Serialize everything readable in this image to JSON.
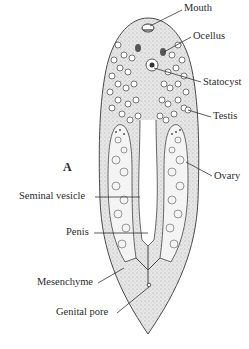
{
  "figure": {
    "panel_letter": "A",
    "colors": {
      "outline": "#4a4a4a",
      "body_fill": "#d9d9d9",
      "inner_fill": "#f4f4f4",
      "text": "#2a2a2a"
    }
  },
  "labels": {
    "mouth": "Mouth",
    "ocellus": "Ocellus",
    "statocyst": "Statocyst",
    "testis": "Testis",
    "ovary": "Ovary",
    "seminal_vesicle": "Seminal vesicle",
    "penis": "Penis",
    "mesenchyme": "Mesenchyme",
    "genital_pore": "Genital pore"
  }
}
